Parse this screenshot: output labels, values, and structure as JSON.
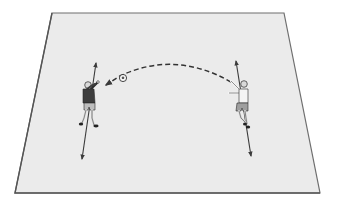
{
  "diagram": {
    "type": "soccer-drill",
    "view": "perspective-pitch",
    "colors": {
      "background": "#ffffff",
      "field_fill": "#ebebeb",
      "field_border": "#6e6e6e",
      "arrow": "#3a3a3a",
      "dark_shirt": "#3d3d3d",
      "light_shirt": "#f4f4f4",
      "shorts": "#bdbdbd",
      "skin": "#d9d9d9",
      "outline": "#2a2a2a"
    },
    "field": {
      "corners": [
        [
          52,
          13
        ],
        [
          284,
          13
        ],
        [
          320,
          193
        ],
        [
          15,
          193
        ]
      ]
    },
    "players": [
      {
        "id": "player-left",
        "role": "receiver",
        "shirt": "dark",
        "position": [
          90,
          105
        ],
        "movement_arrow": {
          "from": [
            81,
            160
          ],
          "to": [
            97,
            62
          ],
          "double_headed": true
        }
      },
      {
        "id": "player-right",
        "role": "thrower",
        "shirt": "light",
        "position": [
          243,
          105
        ],
        "movement_arrow": {
          "from": [
            251,
            157
          ],
          "to": [
            236,
            60
          ],
          "double_headed": true
        }
      }
    ],
    "ball": {
      "position": [
        123,
        78
      ]
    },
    "pass": {
      "style": "dashed-curve",
      "from": [
        231,
        82
      ],
      "to": [
        104,
        86
      ],
      "control": [
        175,
        45
      ],
      "arrowhead_at": "to"
    }
  }
}
